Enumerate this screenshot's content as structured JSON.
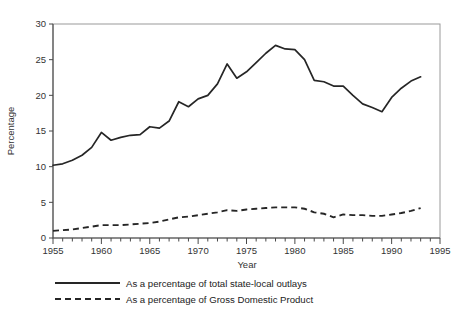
{
  "chart_data": {
    "type": "line",
    "title": "",
    "xlabel": "Year",
    "ylabel": "Percentage",
    "xlim": [
      1955,
      1995
    ],
    "ylim": [
      0,
      30
    ],
    "grid": false,
    "legend_position": "bottom",
    "x_ticks_major": [
      1955,
      1960,
      1965,
      1970,
      1975,
      1980,
      1985,
      1990,
      1995
    ],
    "x_tick_labels": [
      "1955",
      "1960",
      "1965",
      "1970",
      "1975",
      "1980",
      "1985",
      "1990",
      "1995"
    ],
    "x_tick_minor_step": 1,
    "y_ticks": [
      0,
      5,
      10,
      15,
      20,
      25,
      30
    ],
    "y_tick_labels": [
      "0",
      "5",
      "10",
      "15",
      "20",
      "25",
      "30"
    ],
    "x": [
      1955,
      1956,
      1957,
      1958,
      1959,
      1960,
      1961,
      1962,
      1963,
      1964,
      1965,
      1966,
      1967,
      1968,
      1969,
      1970,
      1971,
      1972,
      1973,
      1974,
      1975,
      1976,
      1977,
      1978,
      1979,
      1980,
      1981,
      1982,
      1983,
      1984,
      1985,
      1986,
      1987,
      1988,
      1989,
      1990,
      1991,
      1992,
      1993
    ],
    "series": [
      {
        "name": "As a percentage of total state-local outlays",
        "style": "solid",
        "color": "#262626",
        "values": [
          10.2,
          10.4,
          10.9,
          11.6,
          12.7,
          14.8,
          13.7,
          14.1,
          14.4,
          14.5,
          15.6,
          15.4,
          16.4,
          19.1,
          18.4,
          19.5,
          20.0,
          21.6,
          24.4,
          22.4,
          23.3,
          24.6,
          25.9,
          27.0,
          26.5,
          26.4,
          25.0,
          22.1,
          21.9,
          21.3,
          21.3,
          20.0,
          18.8,
          18.3,
          17.7,
          19.7,
          21.0,
          22.0,
          22.6
        ]
      },
      {
        "name": "As a percentage of Gross Domestic Product",
        "style": "dashed",
        "color": "#262626",
        "values": [
          1.0,
          1.1,
          1.2,
          1.4,
          1.6,
          1.8,
          1.8,
          1.8,
          1.9,
          2.0,
          2.1,
          2.3,
          2.6,
          2.9,
          3.0,
          3.2,
          3.4,
          3.6,
          3.9,
          3.8,
          4.0,
          4.1,
          4.2,
          4.3,
          4.3,
          4.3,
          4.1,
          3.6,
          3.4,
          2.9,
          3.3,
          3.2,
          3.2,
          3.1,
          3.1,
          3.3,
          3.5,
          3.8,
          4.2
        ]
      }
    ],
    "legend": [
      {
        "label": "As a percentage of total state-local outlays",
        "style": "solid"
      },
      {
        "label": "As a percentage of Gross Domestic Product",
        "style": "dashed"
      }
    ]
  }
}
